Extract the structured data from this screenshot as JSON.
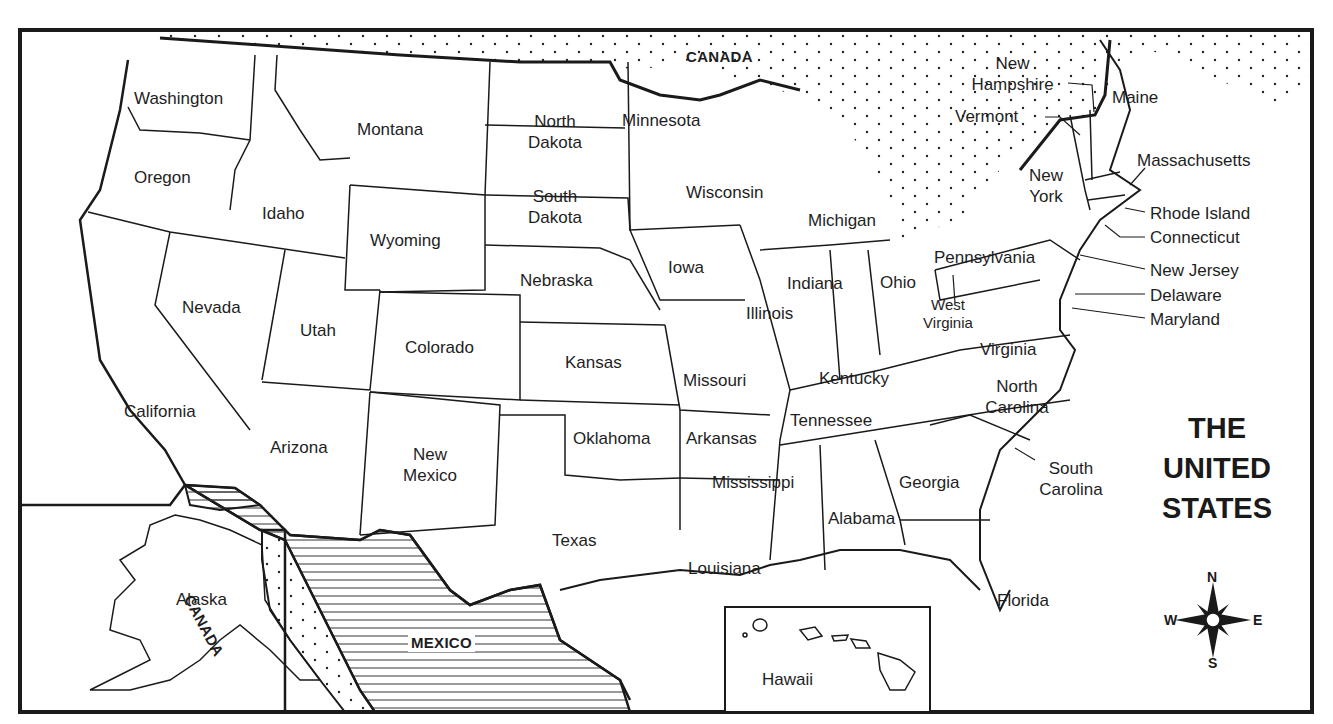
{
  "map": {
    "title_lines": [
      "THE",
      "UNITED",
      "STATES"
    ],
    "neighbors": {
      "canada_top": "CANADA",
      "canada_alaska": "CANADA",
      "mexico": "MEXICO"
    },
    "states": {
      "washington": "Washington",
      "oregon": "Oregon",
      "california": "California",
      "idaho": "Idaho",
      "nevada": "Nevada",
      "montana": "Montana",
      "wyoming": "Wyoming",
      "utah": "Utah",
      "arizona": "Arizona",
      "colorado": "Colorado",
      "new_mexico": [
        "New",
        "Mexico"
      ],
      "north_dakota": [
        "North",
        "Dakota"
      ],
      "south_dakota": [
        "South",
        "Dakota"
      ],
      "nebraska": "Nebraska",
      "kansas": "Kansas",
      "oklahoma": "Oklahoma",
      "texas": "Texas",
      "minnesota": "Minnesota",
      "iowa": "Iowa",
      "missouri": "Missouri",
      "arkansas": "Arkansas",
      "louisiana": "Louisiana",
      "wisconsin": "Wisconsin",
      "illinois": "Illinois",
      "michigan": "Michigan",
      "indiana": "Indiana",
      "ohio": "Ohio",
      "kentucky": "Kentucky",
      "tennessee": "Tennessee",
      "mississippi": "Mississippi",
      "alabama": "Alabama",
      "georgia": "Georgia",
      "florida": "Florida",
      "south_carolina": [
        "South",
        "Carolina"
      ],
      "north_carolina": [
        "North",
        "Carolina"
      ],
      "virginia": "Virginia",
      "west_virginia": [
        "West",
        "Virginia"
      ],
      "pennsylvania": "Pennsylvania",
      "new_york": [
        "New",
        "York"
      ],
      "vermont": "Vermont",
      "new_hampshire": [
        "New",
        "Hampshire"
      ],
      "maine": "Maine",
      "massachusetts": "Massachusetts",
      "rhode_island": "Rhode Island",
      "connecticut": "Connecticut",
      "new_jersey": "New Jersey",
      "delaware": "Delaware",
      "maryland": "Maryland",
      "alaska": "Alaska",
      "hawaii": "Hawaii"
    },
    "compass": {
      "n": "N",
      "s": "S",
      "e": "E",
      "w": "W"
    },
    "colors": {
      "ink": "#1a1a1a",
      "background": "#ffffff"
    }
  }
}
